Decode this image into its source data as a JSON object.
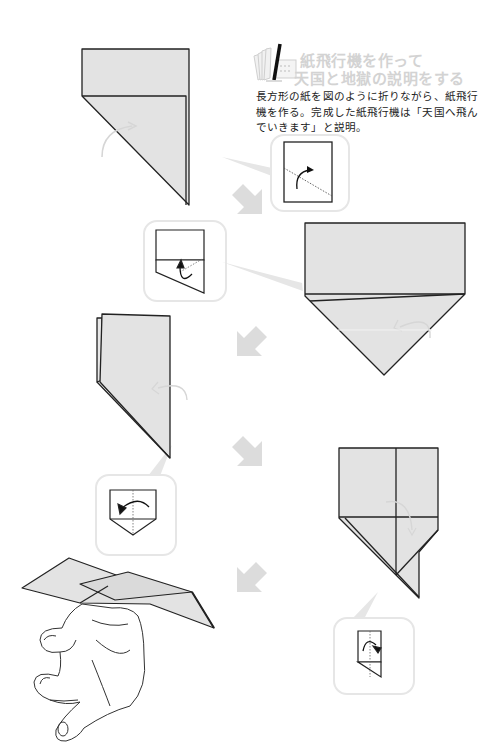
{
  "step": {
    "number": "1",
    "icon": "paper-fan-number-icon",
    "title_lines": [
      "紙飛行機を作って",
      "天国と地獄の説明をする"
    ],
    "description_lines": [
      "長方形の紙を図のように折りながら、紙飛行",
      "機を作る。完成した紙飛行機は「天国へ飛ん",
      "でいきます」と説明。"
    ]
  },
  "colors": {
    "paper_fill": "#e3e3e3",
    "outline": "#222222",
    "arrow_gray": "#dcdcdc",
    "callout_border": "#e6e6e6",
    "title_gray": "#d3d3d3",
    "text": "#222222"
  },
  "diagrams": [
    {
      "id": "fold-1",
      "label": "folded rectangle with diagonal corner fold"
    },
    {
      "id": "callout-1",
      "label": "fold corner along dotted line"
    },
    {
      "id": "callout-2",
      "label": "fold lower edge up"
    },
    {
      "id": "fold-2",
      "label": "pentagon shape with folded corners"
    },
    {
      "id": "fold-3",
      "label": "folded in half narrow shape"
    },
    {
      "id": "callout-3",
      "label": "fold in half along center line"
    },
    {
      "id": "fold-4",
      "label": "fold wing down"
    },
    {
      "id": "callout-4",
      "label": "fold wing along dotted line"
    },
    {
      "id": "result",
      "label": "hand holding completed paper airplane"
    }
  ],
  "flow_arrows": [
    "down-right",
    "down-left",
    "down-right",
    "down-left"
  ]
}
